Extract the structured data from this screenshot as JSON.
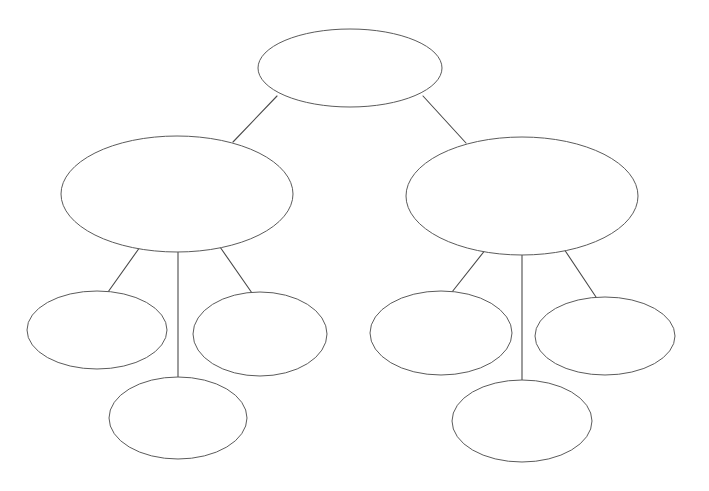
{
  "document": {
    "title": "Blank hierarchy diagram",
    "background_color": "#ffffff",
    "canvas_width": 709,
    "canvas_height": 491
  },
  "style": {
    "node_fill": "#ffffff",
    "node_stroke": "#5b5b5b",
    "edge_stroke": "#4a4a4a",
    "node_stroke_width": 1,
    "edge_stroke_width": 1.1
  },
  "diagram": {
    "type": "tree",
    "levels": 3,
    "node_count": 9,
    "edge_count": 8,
    "nodes": [
      {
        "id": "root",
        "label": "",
        "level": 0,
        "cx": 350,
        "cy": 68,
        "rx": 92,
        "ry": 39
      },
      {
        "id": "branch-left",
        "label": "",
        "level": 1,
        "cx": 177,
        "cy": 194,
        "rx": 116,
        "ry": 58
      },
      {
        "id": "branch-right",
        "label": "",
        "level": 1,
        "cx": 522,
        "cy": 196,
        "rx": 116,
        "ry": 59
      },
      {
        "id": "leaf-left-1",
        "label": "",
        "level": 2,
        "cx": 97,
        "cy": 330,
        "rx": 70,
        "ry": 39
      },
      {
        "id": "leaf-left-2",
        "label": "",
        "level": 2,
        "cx": 260,
        "cy": 334,
        "rx": 67,
        "ry": 42
      },
      {
        "id": "leaf-left-3",
        "label": "",
        "level": 2,
        "cx": 178,
        "cy": 418,
        "rx": 69,
        "ry": 41
      },
      {
        "id": "leaf-right-1",
        "label": "",
        "level": 2,
        "cx": 441,
        "cy": 333,
        "rx": 71,
        "ry": 42
      },
      {
        "id": "leaf-right-2",
        "label": "",
        "level": 2,
        "cx": 605,
        "cy": 336,
        "rx": 70,
        "ry": 39
      },
      {
        "id": "leaf-right-3",
        "label": "",
        "level": 2,
        "cx": 522,
        "cy": 421,
        "rx": 70,
        "ry": 41
      }
    ],
    "edges": [
      {
        "id": "edge-root-left",
        "from": "root",
        "to": "branch-left",
        "label": "",
        "x1": 277,
        "y1": 96,
        "x2": 233,
        "y2": 142
      },
      {
        "id": "edge-root-right",
        "from": "root",
        "to": "branch-right",
        "label": "",
        "x1": 423,
        "y1": 96,
        "x2": 466,
        "y2": 143
      },
      {
        "id": "edge-left-1",
        "from": "branch-left",
        "to": "leaf-left-1",
        "label": "",
        "x1": 140,
        "y1": 247,
        "x2": 108,
        "y2": 292
      },
      {
        "id": "edge-left-2",
        "from": "branch-left",
        "to": "leaf-left-3",
        "label": "",
        "x1": 178,
        "y1": 252,
        "x2": 178,
        "y2": 378
      },
      {
        "id": "edge-left-3",
        "from": "branch-left",
        "to": "leaf-left-2",
        "label": "",
        "x1": 220,
        "y1": 247,
        "x2": 252,
        "y2": 293
      },
      {
        "id": "edge-right-1",
        "from": "branch-right",
        "to": "leaf-right-1",
        "label": "",
        "x1": 486,
        "y1": 249,
        "x2": 452,
        "y2": 292
      },
      {
        "id": "edge-right-2",
        "from": "branch-right",
        "to": "leaf-right-3",
        "label": "",
        "x1": 522,
        "y1": 255,
        "x2": 522,
        "y2": 381
      },
      {
        "id": "edge-right-3",
        "from": "branch-right",
        "to": "leaf-right-2",
        "label": "",
        "x1": 564,
        "y1": 249,
        "x2": 596,
        "y2": 297
      }
    ]
  }
}
